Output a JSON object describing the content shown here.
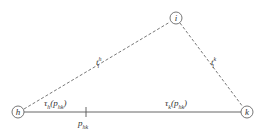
{
  "diagram": {
    "nodes": [
      {
        "id": "h",
        "label": "h",
        "x": 18,
        "y": 112
      },
      {
        "id": "i",
        "label": "i",
        "x": 176,
        "y": 18
      },
      {
        "id": "k",
        "label": "k",
        "x": 247,
        "y": 112
      }
    ],
    "edges": [
      {
        "from": "h",
        "to": "i",
        "style": "dashed",
        "label": {
          "base": "t",
          "sub": "i",
          "sup": "h"
        }
      },
      {
        "from": "i",
        "to": "k",
        "style": "dashed",
        "label": {
          "base": "t",
          "sub": "i",
          "sup": "k"
        }
      },
      {
        "from": "h",
        "to": "k",
        "style": "solid"
      }
    ],
    "segment_labels": {
      "left": {
        "base": "τ",
        "sub": "h",
        "arg": "(p",
        "arg_sub": "hk",
        "close": ")"
      },
      "right": {
        "base": "τ",
        "sub": "k",
        "arg": "(p",
        "arg_sub": "hk",
        "close": ")"
      }
    },
    "tick": {
      "x": 86,
      "label": {
        "base": "p",
        "sub": "hk"
      }
    },
    "colors": {
      "line": "#444444",
      "background": "#ffffff"
    }
  }
}
